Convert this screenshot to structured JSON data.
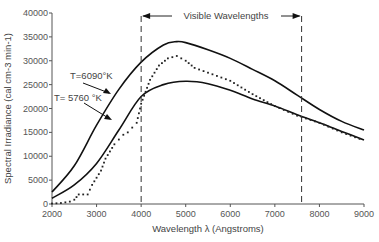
{
  "chart_data": {
    "type": "line",
    "title": "",
    "xlabel": "Wavelength λ (Angstroms)",
    "ylabel": "Spectral Irradiance (cal cm-3 min-1)",
    "xlim": [
      2000,
      9000
    ],
    "ylim": [
      0,
      40000
    ],
    "x_ticks": [
      "2000",
      "3000",
      "4000",
      "5000",
      "6000",
      "7000",
      "8000",
      "9000"
    ],
    "y_ticks": [
      "0",
      "5000",
      "10000",
      "15000",
      "20000",
      "25000",
      "30000",
      "35000",
      "40000"
    ],
    "grid": false,
    "annotations": [
      {
        "text": "Visible Wavelengths",
        "range": [
          4000,
          7600
        ]
      },
      {
        "text": "T=6090°K",
        "points_to": "upper curve"
      },
      {
        "text": "T= 5760 °K",
        "points_to": "lower curve"
      }
    ],
    "series": [
      {
        "name": "T=6090°K",
        "style": "solid",
        "x": [
          2000,
          2500,
          3000,
          3500,
          4000,
          4500,
          4800,
          5000,
          5500,
          6000,
          6500,
          7000,
          7500,
          8000,
          8500,
          9000
        ],
        "values": [
          2500,
          8000,
          16500,
          24000,
          29700,
          33300,
          34000,
          33800,
          32300,
          30500,
          28200,
          25800,
          22800,
          19800,
          17300,
          15500
        ]
      },
      {
        "name": "T= 5760°K",
        "style": "solid",
        "x": [
          2000,
          2500,
          3000,
          3500,
          4000,
          4500,
          5000,
          5500,
          6000,
          6500,
          7000,
          7500,
          8000,
          8500,
          9000
        ],
        "values": [
          1200,
          4000,
          8500,
          15500,
          22500,
          25000,
          25700,
          25200,
          23800,
          22000,
          20500,
          18700,
          17000,
          15200,
          13400
        ]
      },
      {
        "name": "Measured solar spectrum",
        "style": "dotted",
        "x": [
          2000,
          2200,
          2400,
          2500,
          2600,
          2800,
          2900,
          3000,
          3100,
          3200,
          3300,
          3400,
          3500,
          3600,
          3700,
          3800,
          3900,
          4000,
          4200,
          4400,
          4600,
          4800,
          5000,
          5200,
          5500,
          6000,
          6500,
          7000,
          7500,
          8000,
          8500,
          9000
        ],
        "values": [
          100,
          200,
          500,
          900,
          2000,
          2000,
          4000,
          5500,
          7000,
          9500,
          11000,
          12500,
          13500,
          14500,
          15000,
          16000,
          17000,
          21000,
          26000,
          29000,
          30500,
          31000,
          30000,
          28500,
          27500,
          25800,
          23000,
          20500,
          18500,
          17000,
          15000,
          13300
        ]
      }
    ]
  }
}
